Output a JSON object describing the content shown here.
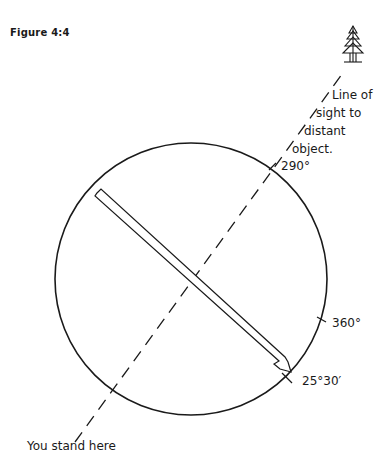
{
  "figure": {
    "label": "Figure 4:4"
  },
  "annotations": {
    "line_of_sight": [
      "Line of",
      "sight to",
      "distant",
      "object."
    ],
    "bearing_290": "290°",
    "bearing_360": "360°",
    "bearing_25_30": "25°30′",
    "observer": "You stand here"
  },
  "icons": {
    "distant_object": "tree-icon"
  },
  "colors": {
    "ink": "#1a1a1a",
    "background": "#ffffff"
  }
}
